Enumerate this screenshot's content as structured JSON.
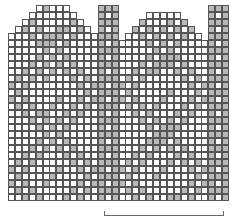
{
  "chart": {
    "type": "knitting-chart",
    "cols": 32,
    "rows": 28,
    "cell_px": 7,
    "colors": {
      "filled": "#b8b8b8",
      "empty": "#ffffff",
      "line": "#555555"
    },
    "bracket": {
      "x1": 104,
      "x2": 222,
      "y": 215
    }
  }
}
